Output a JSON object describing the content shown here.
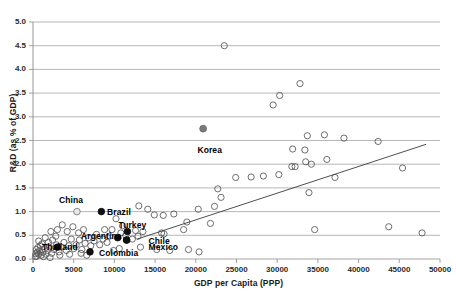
{
  "chart_data": {
    "type": "scatter",
    "title": "",
    "xlabel": "GDP per Capita (PPP)",
    "ylabel": "R&D (as % of GDP)",
    "xlim": [
      0,
      50000
    ],
    "ylim": [
      0.0,
      5.0
    ],
    "xticks": [
      "0",
      "5000",
      "10000",
      "15000",
      "20000",
      "25000",
      "30000",
      "35000",
      "40000",
      "45000",
      "50000"
    ],
    "yticks": [
      "0.0",
      "0.5",
      "1.0",
      "1.5",
      "2.0",
      "2.5",
      "3.0",
      "3.5",
      "4.0",
      "4.5",
      "5.0"
    ],
    "grid": "horizontal",
    "legend": "none",
    "marker_style": "hollow-circle",
    "highlight_marker_style": "filled-circle",
    "trendline": {
      "x0": 12800,
      "y0": 0.42,
      "x1": 48300,
      "y1": 2.42,
      "color": "#3a3a3a"
    },
    "annotations": [
      {
        "label": "Korea",
        "x": 20900,
        "y": 2.75,
        "lx": 20200,
        "ly": 2.28,
        "highlight": "gray"
      },
      {
        "label": "China",
        "x": 5400,
        "y": 1.0,
        "lx": 3200,
        "ly": 1.22,
        "highlight": "light"
      },
      {
        "label": "Brazil",
        "x": 8400,
        "y": 1.0,
        "lx": 9100,
        "ly": 0.98,
        "highlight": "black"
      },
      {
        "label": "Turkey",
        "x": 11600,
        "y": 0.58,
        "lx": 10500,
        "ly": 0.7,
        "highlight": "black"
      },
      {
        "label": "Argentina",
        "x": 10400,
        "y": 0.45,
        "lx": 5900,
        "ly": 0.47,
        "highlight": "black"
      },
      {
        "label": "Chile",
        "x": 11500,
        "y": 0.4,
        "lx": 14200,
        "ly": 0.37,
        "highlight": "black"
      },
      {
        "label": "Mexico",
        "x": 11500,
        "y": 0.4,
        "lx": 14200,
        "ly": 0.24,
        "highlight": "black"
      },
      {
        "label": "Colombia",
        "x": 7000,
        "y": 0.15,
        "lx": 8100,
        "ly": 0.1,
        "highlight": "black"
      },
      {
        "label": "Thailand",
        "x": 3000,
        "y": 0.25,
        "lx": 1100,
        "ly": 0.24,
        "highlight": "black"
      }
    ],
    "points": [
      [
        23500,
        4.5
      ],
      [
        30300,
        3.45
      ],
      [
        29500,
        3.25
      ],
      [
        32800,
        3.7
      ],
      [
        33700,
        2.6
      ],
      [
        35800,
        2.62
      ],
      [
        38200,
        2.55
      ],
      [
        31900,
        2.32
      ],
      [
        33400,
        2.3
      ],
      [
        33500,
        2.05
      ],
      [
        36100,
        2.1
      ],
      [
        42400,
        2.48
      ],
      [
        45400,
        1.92
      ],
      [
        37100,
        1.72
      ],
      [
        30200,
        1.78
      ],
      [
        28300,
        1.75
      ],
      [
        26800,
        1.73
      ],
      [
        24900,
        1.72
      ],
      [
        31800,
        1.95
      ],
      [
        32200,
        1.95
      ],
      [
        34200,
        2.0
      ],
      [
        33900,
        1.4
      ],
      [
        34600,
        0.62
      ],
      [
        43700,
        0.68
      ],
      [
        47800,
        0.55
      ],
      [
        22700,
        1.48
      ],
      [
        23100,
        1.3
      ],
      [
        22300,
        1.11
      ],
      [
        20300,
        1.05
      ],
      [
        21800,
        0.75
      ],
      [
        18900,
        0.78
      ],
      [
        19100,
        0.2
      ],
      [
        18500,
        0.62
      ],
      [
        20400,
        0.15
      ],
      [
        17300,
        0.95
      ],
      [
        16000,
        0.92
      ],
      [
        15800,
        0.55
      ],
      [
        16100,
        0.53
      ],
      [
        14900,
        0.93
      ],
      [
        14100,
        1.05
      ],
      [
        13000,
        1.12
      ],
      [
        13500,
        0.58
      ],
      [
        12600,
        0.6
      ],
      [
        12200,
        0.42
      ],
      [
        11000,
        0.7
      ],
      [
        10200,
        0.85
      ],
      [
        9700,
        0.62
      ],
      [
        9400,
        0.48
      ],
      [
        9100,
        0.35
      ],
      [
        8800,
        0.62
      ],
      [
        8600,
        0.42
      ],
      [
        8200,
        0.3
      ],
      [
        7800,
        0.52
      ],
      [
        7500,
        0.38
      ],
      [
        7100,
        0.28
      ],
      [
        6800,
        0.45
      ],
      [
        6400,
        0.33
      ],
      [
        6000,
        0.2
      ],
      [
        5700,
        0.4
      ],
      [
        5300,
        0.3
      ],
      [
        5000,
        0.22
      ],
      [
        4700,
        0.42
      ],
      [
        4400,
        0.28
      ],
      [
        4100,
        0.18
      ],
      [
        3800,
        0.35
      ],
      [
        3500,
        0.25
      ],
      [
        3200,
        0.15
      ],
      [
        2900,
        0.3
      ],
      [
        2600,
        0.2
      ],
      [
        2300,
        0.12
      ],
      [
        2000,
        0.25
      ],
      [
        1800,
        0.18
      ],
      [
        1600,
        0.1
      ],
      [
        1400,
        0.22
      ],
      [
        1200,
        0.14
      ],
      [
        1000,
        0.08
      ],
      [
        900,
        0.28
      ],
      [
        800,
        0.18
      ],
      [
        700,
        0.1
      ],
      [
        600,
        0.24
      ],
      [
        500,
        0.14
      ],
      [
        450,
        0.06
      ],
      [
        400,
        0.2
      ],
      [
        350,
        0.11
      ],
      [
        300,
        0.05
      ],
      [
        3000,
        0.62
      ],
      [
        2200,
        0.58
      ],
      [
        1500,
        0.45
      ],
      [
        2800,
        0.48
      ],
      [
        3600,
        0.72
      ],
      [
        4200,
        0.58
      ],
      [
        4900,
        0.68
      ],
      [
        5600,
        0.55
      ],
      [
        6200,
        0.62
      ],
      [
        10800,
        0.55
      ],
      [
        11400,
        0.5
      ],
      [
        12900,
        0.48
      ],
      [
        1900,
        0.35
      ],
      [
        2400,
        0.4
      ],
      [
        1100,
        0.32
      ],
      [
        700,
        0.38
      ],
      [
        1300,
        0.05
      ],
      [
        2100,
        0.03
      ],
      [
        3300,
        0.08
      ],
      [
        4500,
        0.1
      ],
      [
        5900,
        0.12
      ],
      [
        6600,
        0.08
      ],
      [
        9900,
        0.18
      ],
      [
        10600,
        0.22
      ],
      [
        13200,
        0.25
      ],
      [
        15200,
        0.2
      ],
      [
        16800,
        0.18
      ]
    ]
  }
}
